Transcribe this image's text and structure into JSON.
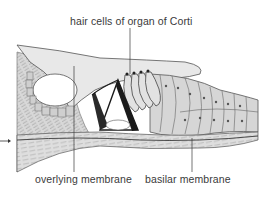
{
  "figure": {
    "labels": {
      "hair_cells": "hair cells of organ of Corti",
      "overlying_membrane": "overlying membrane",
      "basilar_membrane": "basilar membrane"
    },
    "pointer_arrow": "arrow-right-icon",
    "colors": {
      "background": "#ffffff",
      "tissue_fill": "#d9d9d9",
      "membrane_fill": "#e6e6e6",
      "line": "#4a4a4a",
      "dark_structure": "#1a1a1a",
      "label_text": "#3a3a3a"
    }
  }
}
